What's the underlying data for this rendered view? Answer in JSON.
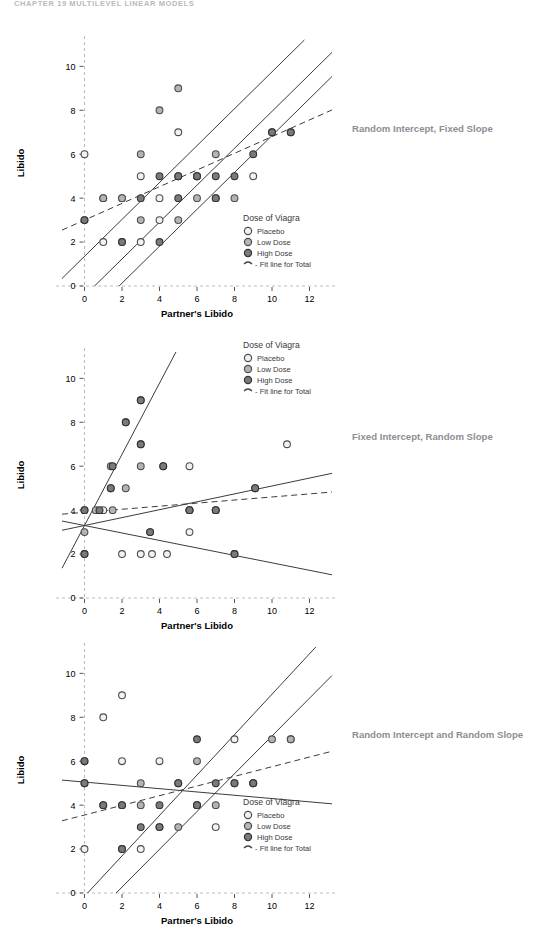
{
  "page": {
    "chapter_header": "CHAPTER 19   MULTILEVEL LINEAR MODELS"
  },
  "annotations": {
    "panel1": "Random Intercept, Fixed Slope",
    "panel2": "Fixed Intercept, Random Slope",
    "panel3": "Random Intercept and Random Slope"
  },
  "legend": {
    "title": "Dose of Viagra",
    "items": [
      {
        "label": "Placebo",
        "fill": "#f2f2f2",
        "stroke": "#4d4d4d"
      },
      {
        "label": "Low Dose",
        "fill": "#b4b4b4",
        "stroke": "#4d4d4d"
      },
      {
        "label": "High Dose",
        "fill": "#7a7a7a",
        "stroke": "#333333"
      }
    ],
    "fit_line_label": "- Fit line for Total"
  },
  "axes": {
    "xlabel": "Partner's Libido",
    "ylabel": "Libido",
    "xticks": [
      0,
      2,
      4,
      6,
      8,
      10,
      12
    ],
    "yticks": [
      0,
      2,
      4,
      6,
      8,
      10
    ],
    "xlim": [
      -1.2,
      13.2
    ],
    "ylim": [
      0,
      11.2
    ],
    "axis_color": "#bdbdbd"
  },
  "chart_data": [
    {
      "type": "scatter",
      "title": "Random Intercept, Fixed Slope",
      "xlabel": "Partner's Libido",
      "ylabel": "Libido",
      "xlim": [
        -1.2,
        13.2
      ],
      "ylim": [
        0,
        11.2
      ],
      "grid": false,
      "legend_position": "inside-right-lower",
      "series": [
        {
          "name": "Placebo",
          "points": [
            [
              0,
              6
            ],
            [
              1,
              2
            ],
            [
              2,
              2
            ],
            [
              3,
              2
            ],
            [
              4,
              4
            ],
            [
              5,
              5
            ],
            [
              6,
              5
            ],
            [
              7,
              4
            ],
            [
              9,
              5
            ],
            [
              2,
              4
            ],
            [
              3,
              5
            ],
            [
              5,
              7
            ],
            [
              4,
              3
            ],
            [
              1,
              4
            ]
          ]
        },
        {
          "name": "Low Dose",
          "points": [
            [
              0,
              3
            ],
            [
              1,
              4
            ],
            [
              2,
              4
            ],
            [
              3,
              6
            ],
            [
              4,
              8
            ],
            [
              5,
              9
            ],
            [
              5,
              3
            ],
            [
              6,
              5
            ],
            [
              7,
              6
            ],
            [
              8,
              4
            ],
            [
              10,
              7
            ],
            [
              11,
              7
            ],
            [
              6,
              4
            ],
            [
              3,
              3
            ]
          ]
        },
        {
          "name": "High Dose",
          "points": [
            [
              0,
              3
            ],
            [
              2,
              2
            ],
            [
              4,
              2
            ],
            [
              5,
              5
            ],
            [
              6,
              5
            ],
            [
              7,
              4
            ],
            [
              8,
              5
            ],
            [
              9,
              6
            ],
            [
              10,
              7
            ],
            [
              11,
              7
            ],
            [
              3,
              4
            ],
            [
              5,
              4
            ],
            [
              7,
              5
            ],
            [
              4,
              5
            ]
          ]
        }
      ],
      "lines": [
        {
          "name": "Placebo fit",
          "style": "solid",
          "intercept": 1.35,
          "slope": 0.84
        },
        {
          "name": "Low Dose fit",
          "style": "solid",
          "intercept": -0.45,
          "slope": 0.84
        },
        {
          "name": "High Dose fit",
          "style": "solid",
          "intercept": -1.55,
          "slope": 0.84
        },
        {
          "name": "Fit line for Total",
          "style": "dashed",
          "intercept": 3.0,
          "slope": 0.38
        }
      ]
    },
    {
      "type": "scatter",
      "title": "Fixed Intercept, Random Slope",
      "xlabel": "Partner's Libido",
      "ylabel": "Libido",
      "xlim": [
        -1.2,
        13.2
      ],
      "ylim": [
        0,
        11.2
      ],
      "grid": false,
      "legend_position": "inside-right-upper",
      "series": [
        {
          "name": "Placebo",
          "points": [
            [
              0,
              4
            ],
            [
              0,
              2
            ],
            [
              1,
              4
            ],
            [
              2,
              2
            ],
            [
              3,
              2
            ],
            [
              3.6,
              2
            ],
            [
              4.4,
              2
            ],
            [
              3.5,
              3
            ],
            [
              5.6,
              3
            ],
            [
              5.6,
              4
            ],
            [
              7,
              4
            ],
            [
              8,
              2
            ],
            [
              10.8,
              7
            ],
            [
              5.6,
              6
            ]
          ]
        },
        {
          "name": "Low Dose",
          "points": [
            [
              0,
              3
            ],
            [
              0.6,
              4
            ],
            [
              1.4,
              5
            ],
            [
              1.5,
              4
            ],
            [
              2.2,
              8
            ],
            [
              3,
              9
            ],
            [
              3,
              6
            ],
            [
              3,
              7
            ],
            [
              4.2,
              6
            ],
            [
              5.6,
              4
            ],
            [
              7,
              4
            ],
            [
              9.1,
              5
            ],
            [
              2.2,
              5
            ],
            [
              1.4,
              6
            ]
          ]
        },
        {
          "name": "High Dose",
          "points": [
            [
              0,
              4
            ],
            [
              0.8,
              4
            ],
            [
              1.4,
              5
            ],
            [
              3,
              7
            ],
            [
              3,
              9
            ],
            [
              2.2,
              8
            ],
            [
              5.6,
              4
            ],
            [
              7,
              4
            ],
            [
              8,
              2
            ],
            [
              9.1,
              5
            ],
            [
              4.2,
              6
            ],
            [
              1.5,
              6
            ],
            [
              0,
              2
            ],
            [
              3.5,
              3
            ]
          ]
        }
      ],
      "lines": [
        {
          "name": "Steep slope group",
          "style": "solid",
          "intercept": 3.3,
          "slope": 1.62
        },
        {
          "name": "Shallow slope group",
          "style": "solid",
          "intercept": 3.3,
          "slope": 0.18
        },
        {
          "name": "Negative slope group",
          "style": "solid",
          "intercept": 3.3,
          "slope": -0.17
        },
        {
          "name": "Fit line for Total",
          "style": "dashed",
          "intercept": 3.9,
          "slope": 0.07
        }
      ]
    },
    {
      "type": "scatter",
      "title": "Random Intercept and Random Slope",
      "xlabel": "Partner's Libido",
      "ylabel": "Libido",
      "xlim": [
        -1.2,
        13.2
      ],
      "ylim": [
        0,
        11.2
      ],
      "grid": false,
      "legend_position": "inside-right-lower",
      "series": [
        {
          "name": "Placebo",
          "points": [
            [
              0,
              6
            ],
            [
              0,
              5
            ],
            [
              0,
              2
            ],
            [
              2,
              2
            ],
            [
              3,
              2
            ],
            [
              2,
              6
            ],
            [
              4,
              6
            ],
            [
              7,
              3
            ],
            [
              6,
              4
            ],
            [
              9,
              5
            ],
            [
              11,
              7
            ],
            [
              1,
              8
            ],
            [
              2,
              9
            ],
            [
              8,
              7
            ]
          ]
        },
        {
          "name": "Low Dose",
          "points": [
            [
              1,
              4
            ],
            [
              2,
              4
            ],
            [
              3,
              4
            ],
            [
              4,
              3
            ],
            [
              5,
              3
            ],
            [
              6,
              4
            ],
            [
              7,
              4
            ],
            [
              8,
              5
            ],
            [
              9,
              5
            ],
            [
              10,
              7
            ],
            [
              11,
              7
            ],
            [
              5,
              5
            ],
            [
              6,
              6
            ],
            [
              3,
              5
            ]
          ]
        },
        {
          "name": "High Dose",
          "points": [
            [
              0,
              5
            ],
            [
              1,
              4
            ],
            [
              2,
              4
            ],
            [
              4,
              4
            ],
            [
              5,
              5
            ],
            [
              6,
              4
            ],
            [
              7,
              5
            ],
            [
              8,
              5
            ],
            [
              9,
              5
            ],
            [
              6,
              7
            ],
            [
              4,
              3
            ],
            [
              3,
              3
            ],
            [
              0,
              6
            ],
            [
              2,
              2
            ]
          ]
        }
      ],
      "lines": [
        {
          "name": "Flat/declining group",
          "style": "solid",
          "intercept": 5.05,
          "slope": -0.075
        },
        {
          "name": "Steep group",
          "style": "solid",
          "intercept": -0.15,
          "slope": 0.92
        },
        {
          "name": "Medium group",
          "style": "solid",
          "intercept": -1.45,
          "slope": 0.86
        },
        {
          "name": "Fit line for Total",
          "style": "dashed",
          "intercept": 3.55,
          "slope": 0.22
        }
      ]
    }
  ]
}
